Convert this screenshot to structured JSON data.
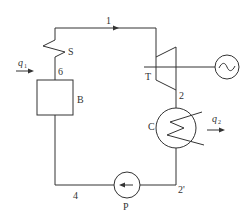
{
  "diagram": {
    "type": "rankine-cycle-schematic",
    "components": {
      "superheater": {
        "label": "S"
      },
      "boiler": {
        "label": "B"
      },
      "turbine": {
        "label": "T"
      },
      "generator": {
        "symbol": "~"
      },
      "condenser": {
        "label": "C"
      },
      "pump": {
        "label": "P"
      }
    },
    "state_points": {
      "p1": "1",
      "p2": "2",
      "p2prime": "2'",
      "p4": "4",
      "p6": "6"
    },
    "heat_flows": {
      "q_in": {
        "symbol": "q",
        "subscript": "1"
      },
      "q_out": {
        "symbol": "q",
        "subscript": "2"
      }
    },
    "colors": {
      "stroke": "#333333",
      "background": "#ffffff"
    }
  }
}
